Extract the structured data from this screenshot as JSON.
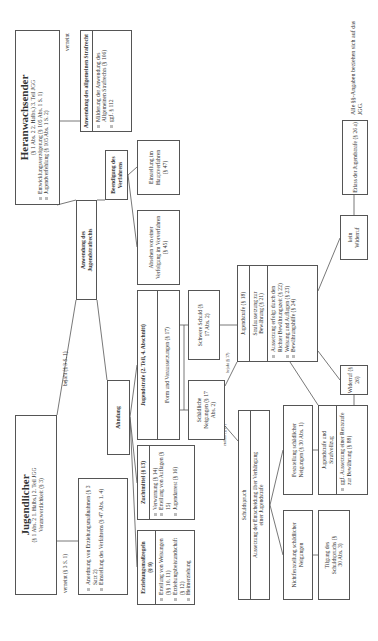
{
  "heranwachsender": {
    "title": "Heranwachsender",
    "subtitle": "(§ 1 Abs. 2 2. Halbs.) 3. Teil JGG",
    "items": [
      "Entwicklungsverzögerung (§ 105 Abs. 1 S. 1)",
      "Jugendverfehlung (§ 105 Abs. 1 S. 2)"
    ]
  },
  "jugendlicher": {
    "title": "Jugendlicher",
    "subtitle": "(§ 1 Abs. 2 1. Halbs.) 2. Teil JGG",
    "subtitle2": "Verantwortlichkeit (§ 3)"
  },
  "labels": {
    "verneint_top": "verneint",
    "bejaht_35": "bejaht (§ 3 S. 1)",
    "verneint_35": "verneint (§ 3 S. 1)",
    "entfaellt": "entfällt (§ 27)",
    "bejaht_17": "bejaht (§ 17)"
  },
  "allg_strafrecht": {
    "title": "Anwendung des allgemeinen Strafrecht",
    "items": [
      "Milderung der Anwendung des Allgemeinen Strafrechts (§ 106)",
      "ggf. § 112"
    ]
  },
  "anwendung_jugendstrafrecht": "Anwendung des Jugendstrafrechts",
  "jugendlicher_massnahmen": {
    "items": [
      "Anordnung von Erziehungsmaßnahmen (§ 3 Satz 2)",
      "Einstellung des Verfahrens (§ 47 Abs. 1, 4)"
    ]
  },
  "beendigung": "Beendigung des Verfahrens",
  "einstellung_haupt": "Einstellung im Hauptverfahren (§ 47)",
  "absehen": "Absehen von einer Verfolgung im Vorverfahren (§ 45)",
  "ahndung": "Ahndung",
  "jugendstrafe_teil": {
    "title": "Jugendstrafe (2. Teil, 4. Abschnitt)",
    "row": "Form und Voraussetzungen (§ 17)"
  },
  "zuchtmittel": {
    "title": "Zuchtmittel (§ 13)",
    "items": [
      "Verwarnung (§ 14)",
      "Erteilung von Auflagen (§ 15)",
      "Jugendarrest (§ 16)"
    ]
  },
  "erziehungsmassregeln": {
    "title": "Erziehungsmaßregeln (§ 9)",
    "items": [
      "Erteilung von Weisungen (§§ 10, 11)",
      "Erziehungsbeistandschaft (§ 12)",
      "Heimerziehung"
    ]
  },
  "schaedliche": "Schädliche Neigungen (§ 17 Abs. 2)",
  "schwere_schuld": "Schwere Schuld (§ 17 Abs. 2)",
  "jugendstrafe18": {
    "title": "Jugendstrafe (§ 18)",
    "row": "Strafaussetzung zur Bewährung (§ 21)",
    "items": [
      "Aussetzung erfolgt durch den Richter Bewährungszeit (§ 22)",
      "Weisung und Auflagen (§ 23)",
      "Bewährungshilfe (§ 24)"
    ]
  },
  "schuldspruch": {
    "title": "Schuldspruch",
    "row": "Aussetzung der Entscheidung über Verhängung einer Jugendstrafe"
  },
  "feststellung": "Feststellung schädlicher Neigungen (§ 30 Abs. 1)",
  "nichtfeststellung": "Nichtfeststellung schädlicher Neigungen",
  "strafvollzug": {
    "title": "Jugendstrafe und Strafvollzug",
    "row": "ggf. Aussetzung einer Reststrafe zur Bewährung (§ 88)"
  },
  "tilgung": "Tilgung des Schuldspruchs (§ 30 Abs. 3)",
  "widerruf": "Widerruf (§ 26)",
  "kein_widerruf": "kein Widerruf",
  "erlass": "Erlass der Jugendstrafe (§ 26 a)",
  "note": "Alle §§-Angaben beziehen sich auf das JGG."
}
